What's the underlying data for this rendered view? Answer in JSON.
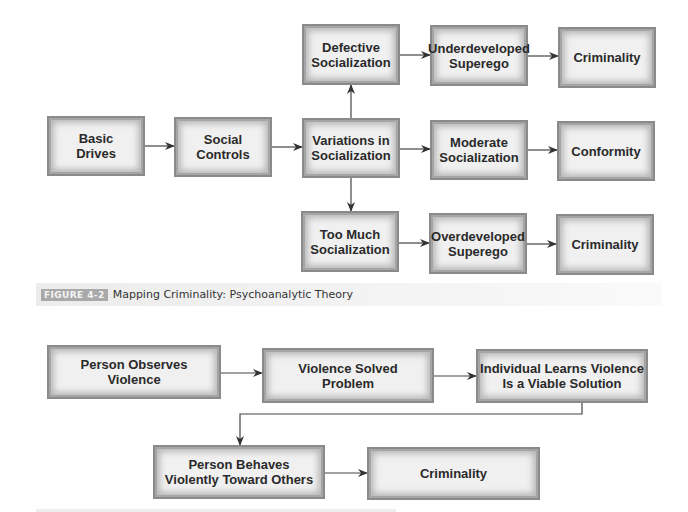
{
  "figure1": {
    "nodes": {
      "basic_drives": "Basic\nDrives",
      "social_controls": "Social\nControls",
      "variations": "Variations in\nSocialization",
      "defective": "Defective\nSocialization",
      "underdeveloped": "Underdeveloped\nSuperego",
      "criminality_top": "Criminality",
      "moderate": "Moderate\nSocialization",
      "conformity": "Conformity",
      "too_much": "Too Much\nSocialization",
      "overdeveloped": "Overdeveloped\nSuperego",
      "criminality_bottom": "Criminality"
    },
    "edges": [
      [
        "Basic Drives",
        "Social Controls"
      ],
      [
        "Social Controls",
        "Variations in Socialization"
      ],
      [
        "Variations in Socialization",
        "Defective Socialization"
      ],
      [
        "Variations in Socialization",
        "Moderate Socialization"
      ],
      [
        "Variations in Socialization",
        "Too Much Socialization"
      ],
      [
        "Defective Socialization",
        "Underdeveloped Superego"
      ],
      [
        "Underdeveloped Superego",
        "Criminality"
      ],
      [
        "Moderate Socialization",
        "Conformity"
      ],
      [
        "Too Much Socialization",
        "Overdeveloped Superego"
      ],
      [
        "Overdeveloped Superego",
        "Criminality"
      ]
    ],
    "caption": {
      "label": "FIGURE 4-2",
      "title": "Mapping Criminality: Psychoanalytic Theory"
    }
  },
  "figure2": {
    "nodes": {
      "observes": "Person Observes\nViolence",
      "solved": "Violence Solved\nProblem",
      "learns": "Individual Learns Violence\nIs a Viable Solution",
      "behaves": "Person Behaves\nViolently Toward Others",
      "criminality": "Criminality"
    },
    "edges": [
      [
        "Person Observes Violence",
        "Violence Solved Problem"
      ],
      [
        "Violence Solved Problem",
        "Individual Learns Violence Is a Viable Solution"
      ],
      [
        "Individual Learns Violence Is a Viable Solution",
        "Person Behaves Violently Toward Others"
      ],
      [
        "Person Behaves Violently Toward Others",
        "Criminality"
      ]
    ]
  },
  "colors": {
    "box_fill": "#f0f0f0",
    "box_border": "#8a8a8a",
    "text": "#2a2a2a",
    "arrow": "#333333",
    "caption_bg": "#ececec",
    "caption_label_bg": "#a9a9a9"
  }
}
